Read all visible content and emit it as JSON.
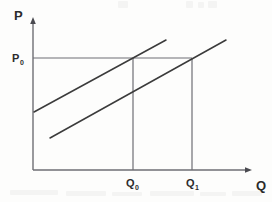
{
  "figure": {
    "background_color": "#fdfdfc",
    "line_color": "#3b3b3b",
    "axis_color": "#6e6e74",
    "text_color": "#2b2b2b"
  },
  "axes": {
    "y_axis": {
      "name": "price-axis",
      "label": "P",
      "label_x": 14,
      "label_y": 20,
      "x": 33,
      "y_top": 18,
      "y_bottom": 170,
      "arrow": "up-arrow"
    },
    "x_axis": {
      "name": "quantity-axis",
      "label": "Q",
      "label_x": 256,
      "label_y": 190,
      "y": 170,
      "x_left": 33,
      "x_right": 252,
      "arrow": "right-arrow"
    }
  },
  "tick_labels": [
    {
      "id": "p0",
      "base": "P",
      "sub": "0",
      "x": 12,
      "y": 62,
      "axis": "price"
    },
    {
      "id": "q0",
      "base": "Q",
      "sub": "0",
      "x": 126,
      "y": 187,
      "axis": "quantity"
    },
    {
      "id": "q1",
      "base": "Q",
      "sub": "1",
      "x": 186,
      "y": 187,
      "axis": "quantity"
    }
  ],
  "guide_lines": [
    {
      "name": "price-level-line-p0",
      "kind": "horizontal",
      "from": [
        33,
        58
      ],
      "to": [
        192,
        58
      ],
      "value_label": "P0"
    },
    {
      "name": "quantity-line-q0",
      "kind": "vertical",
      "from": [
        133,
        58
      ],
      "to": [
        133,
        170
      ],
      "value_label": "Q0"
    },
    {
      "name": "quantity-line-q1",
      "kind": "vertical",
      "from": [
        192,
        58
      ],
      "to": [
        192,
        170
      ],
      "value_label": "Q1"
    }
  ],
  "curves": [
    {
      "name": "supply-curve-original",
      "label": "S0",
      "from": [
        34,
        112
      ],
      "to": [
        166,
        40
      ],
      "description": "upper-left parallel supply line starting on the price axis"
    },
    {
      "name": "supply-curve-shifted",
      "label": "S1",
      "from": [
        50,
        138
      ],
      "to": [
        226,
        40
      ],
      "description": "lower-right parallel supply line shifted to the right"
    }
  ],
  "intersections": [
    {
      "name": "equilibrium-point-q0",
      "x": 133,
      "y": 58
    },
    {
      "name": "equilibrium-point-q1",
      "x": 192,
      "y": 58
    }
  ],
  "chart_data": {
    "type": "line",
    "title": "",
    "xlabel": "Q",
    "ylabel": "P",
    "grid": false,
    "legend": "none",
    "xlim": [
      0,
      272
    ],
    "ylim": [
      0,
      202
    ],
    "annotations": [
      "P",
      "P0",
      "Q",
      "Q0",
      "Q1"
    ],
    "series": [
      {
        "name": "S0",
        "points": [
          [
            34,
            112
          ],
          [
            166,
            40
          ]
        ]
      },
      {
        "name": "S1",
        "points": [
          [
            50,
            138
          ],
          [
            226,
            40
          ]
        ]
      },
      {
        "name": "P0 price level",
        "points": [
          [
            33,
            58
          ],
          [
            192,
            58
          ]
        ]
      },
      {
        "name": "Q0 quantity line",
        "points": [
          [
            133,
            58
          ],
          [
            133,
            170
          ]
        ]
      },
      {
        "name": "Q1 quantity line",
        "points": [
          [
            192,
            58
          ],
          [
            192,
            170
          ]
        ]
      }
    ]
  },
  "scan_artifacts": [
    {
      "x": 118,
      "y": 1,
      "w": 10,
      "h": 7
    },
    {
      "x": 186,
      "y": 1,
      "w": 7,
      "h": 7
    },
    {
      "x": 198,
      "y": 2,
      "w": 6,
      "h": 6
    },
    {
      "x": 208,
      "y": 1,
      "w": 9,
      "h": 7
    },
    {
      "x": 10,
      "y": 190,
      "w": 48,
      "h": 5
    },
    {
      "x": 66,
      "y": 191,
      "w": 40,
      "h": 5
    },
    {
      "x": 112,
      "y": 192,
      "w": 30,
      "h": 4
    },
    {
      "x": 150,
      "y": 191,
      "w": 44,
      "h": 5
    },
    {
      "x": 200,
      "y": 192,
      "w": 26,
      "h": 4
    },
    {
      "x": 232,
      "y": 191,
      "w": 30,
      "h": 5
    }
  ]
}
